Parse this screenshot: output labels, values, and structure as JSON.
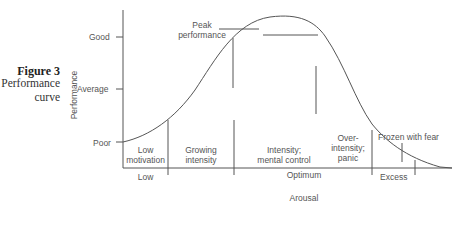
{
  "figure": {
    "title": "Figure 3",
    "caption_line1": "Performance",
    "caption_line2": "curve"
  },
  "y_axis": {
    "label": "Performance",
    "ticks": [
      "Good",
      "Average",
      "Poor"
    ]
  },
  "x_axis": {
    "label": "Arousal",
    "ranges": [
      "Low",
      "Optimum",
      "Excess"
    ]
  },
  "zones": [
    {
      "line1": "Low",
      "line2": "motivation"
    },
    {
      "line1": "Growing",
      "line2": "intensity"
    },
    {
      "line1": "Intensity;",
      "line2": "mental control"
    },
    {
      "line1": "Over-",
      "line2": "intensity;",
      "line3": "panic"
    },
    {
      "line1": "Frozen with fear"
    }
  ],
  "annotations": {
    "peak_line1": "Peak",
    "peak_line2": "performance"
  },
  "colors": {
    "line": "#555555",
    "text": "#555555",
    "title": "#222222"
  }
}
